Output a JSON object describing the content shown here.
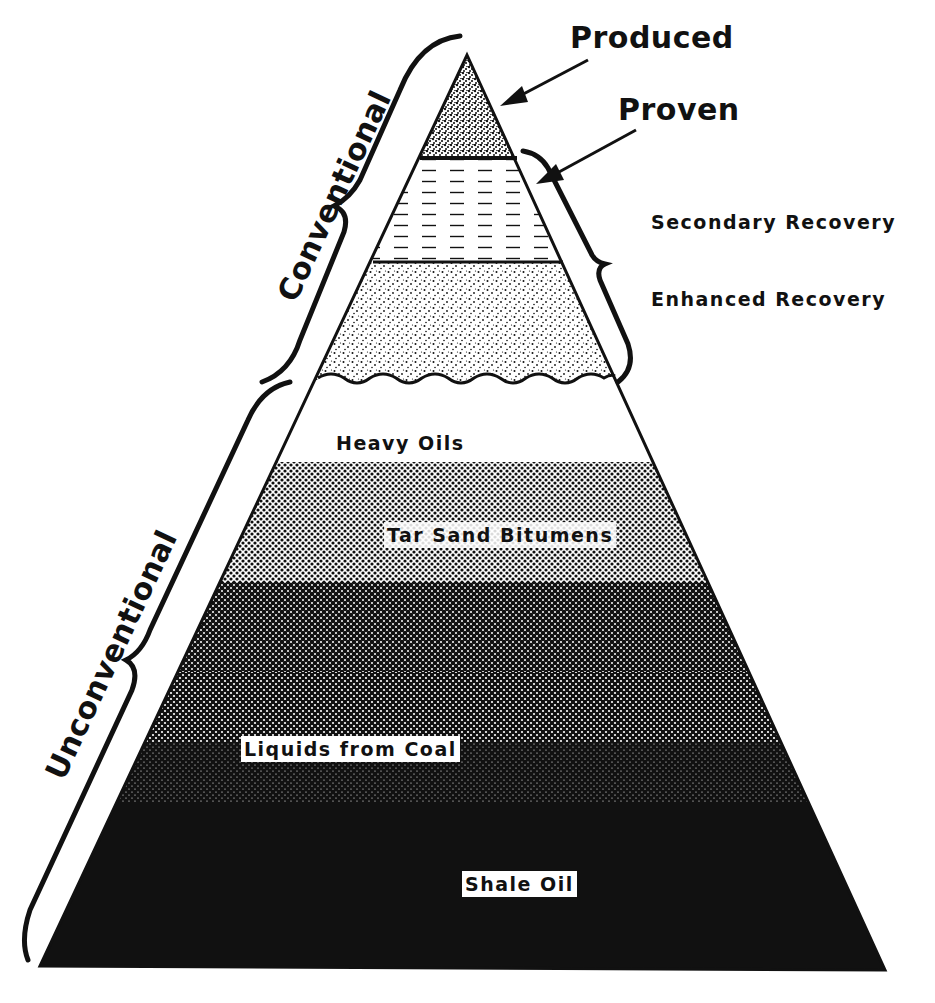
{
  "diagram": {
    "type": "resource-pyramid",
    "colors": {
      "ink": "#111111",
      "paper": "#ffffff"
    },
    "top_labels": {
      "produced": "Produced",
      "proven": "Proven"
    },
    "right_labels": {
      "secondary_recovery": "Secondary Recovery",
      "enhanced_recovery": "Enhanced Recovery"
    },
    "side_labels": {
      "conventional": "Conventional",
      "unconventional": "Unconventional"
    },
    "layers": [
      {
        "name": "Produced",
        "pattern": "dense-stipple",
        "group": "Conventional"
      },
      {
        "name": "Proven",
        "pattern": "dashed-lines",
        "group": "Conventional"
      },
      {
        "name": "Secondary / Enhanced Recovery",
        "pattern": "sparse-stipple",
        "group": "Conventional"
      },
      {
        "name": "Heavy Oils",
        "pattern": "white",
        "group": "Unconventional"
      },
      {
        "name": "Tar Sand Bitumens",
        "pattern": "halftone-light",
        "group": "Unconventional"
      },
      {
        "name": "Liquids from Coal",
        "pattern": "halftone-dark",
        "group": "Unconventional"
      },
      {
        "name": "Shale Oil",
        "pattern": "solid-black",
        "group": "Unconventional"
      }
    ],
    "inner_labels": {
      "heavy_oils": "Heavy Oils",
      "tar_sand": "Tar Sand Bitumens",
      "liquids_coal": "Liquids from Coal",
      "shale_oil": "Shale Oil"
    }
  }
}
